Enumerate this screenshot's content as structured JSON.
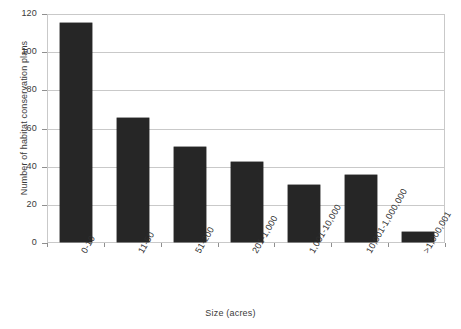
{
  "chart_data": {
    "type": "bar",
    "title": "",
    "xlabel": "Size (acres)",
    "ylabel": "Number of habitat conservation plans",
    "categories": [
      "0-10",
      "11-50",
      "51-200",
      "201-1,000",
      "1,001-10,000",
      "10,001-1,000,000",
      ">1,000,001"
    ],
    "values": [
      115,
      65,
      50,
      42,
      30,
      35,
      5
    ],
    "ylim": [
      0,
      120
    ],
    "yticks": [
      0,
      20,
      40,
      60,
      80,
      100,
      120
    ],
    "ytick_labels": [
      "0",
      "20",
      "40",
      "60",
      "80",
      "100",
      "120"
    ],
    "grid": true,
    "grid_axis": "y",
    "legend": false,
    "bar_color": "#262626",
    "grid_color": "#c9c9c9",
    "text_color": "#3a3a3a",
    "series": [
      {
        "name": "Habitat conservation plans",
        "values": [
          115,
          65,
          50,
          42,
          30,
          35,
          5
        ]
      }
    ]
  }
}
